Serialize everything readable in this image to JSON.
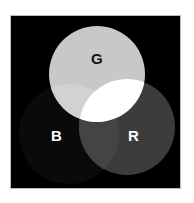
{
  "diagram": {
    "title": "",
    "labels": {
      "green": "G",
      "blue": "B",
      "red": "R"
    },
    "colors": {
      "background": "#000000",
      "green_circle": "#c8c8c8",
      "blue_circle": "#0a0a0a",
      "red_circle": "#3c3c3c",
      "green_blue_overlap": "#d4d4d4",
      "red_blue_overlap": "#444444",
      "all_overlap": "#ffffff",
      "label_light": "#ffffff",
      "label_dark": "#111111"
    }
  }
}
